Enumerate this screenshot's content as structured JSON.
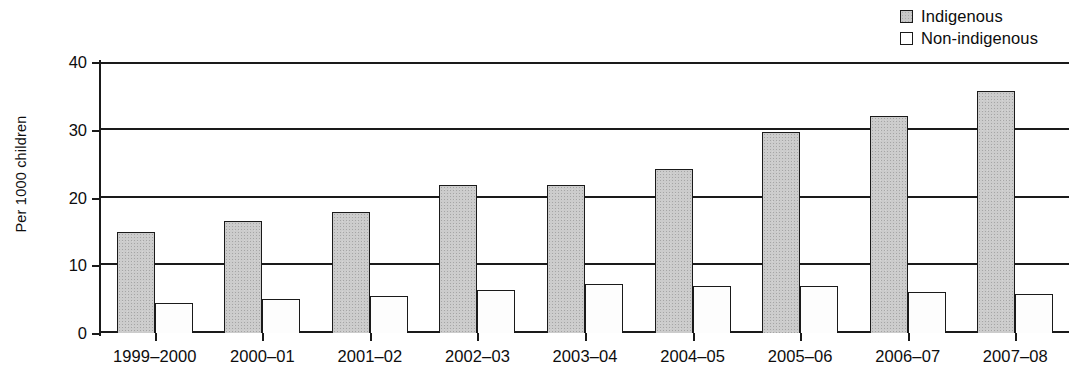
{
  "legend": {
    "position": "top-right",
    "items": [
      {
        "label": "Indigenous",
        "swatch": "filled-gray-square-icon",
        "color": "#cccccc"
      },
      {
        "label": "Non-indigenous",
        "swatch": "empty-white-square-icon",
        "color": "#ffffff"
      }
    ]
  },
  "axes": {
    "y_title": "Per 1000 children",
    "y_ticks": [
      "0",
      "10",
      "20",
      "30",
      "40"
    ]
  },
  "chart_data": {
    "type": "bar",
    "title": "",
    "xlabel": "",
    "ylabel": "Per 1000 children",
    "ylim": [
      0,
      40
    ],
    "yticks": [
      0,
      10,
      20,
      30,
      40
    ],
    "grid": "horizontal",
    "legend_position": "top-right",
    "categories": [
      "1999–2000",
      "2000–01",
      "2001–02",
      "2002–03",
      "2003–04",
      "2004–05",
      "2005–06",
      "2006–07",
      "2007–08"
    ],
    "series": [
      {
        "name": "Indigenous",
        "color": "#cccccc",
        "values": [
          14.9,
          16.5,
          17.9,
          21.9,
          21.9,
          24.2,
          29.6,
          32.0,
          35.7
        ]
      },
      {
        "name": "Non-indigenous",
        "color": "#ffffff",
        "values": [
          4.4,
          5.0,
          5.4,
          6.3,
          7.3,
          6.9,
          6.9,
          6.0,
          5.7
        ]
      }
    ]
  }
}
